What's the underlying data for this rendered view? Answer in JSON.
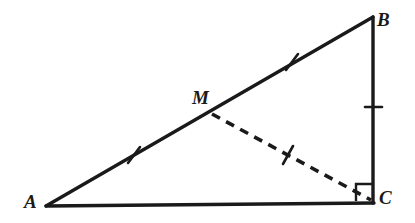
{
  "figure": {
    "type": "geometry-diagram",
    "canvas": {
      "width": 415,
      "height": 223,
      "background": "#ffffff"
    },
    "stroke_color": "#1a1a1a",
    "labels": {
      "a": "A",
      "b": "B",
      "c": "C",
      "m": "M"
    },
    "points": {
      "A": {
        "x": 46,
        "y": 206,
        "label": "A",
        "label_x": 31,
        "label_y": 202
      },
      "B": {
        "x": 373,
        "y": 17,
        "label": "B",
        "label_x": 384,
        "label_y": 20
      },
      "C": {
        "x": 373,
        "y": 202,
        "label": "C",
        "label_x": 386,
        "label_y": 198
      },
      "M": {
        "x": 212,
        "y": 114,
        "label": "M",
        "label_x": 200,
        "label_y": 99
      }
    },
    "segments": [
      {
        "name": "hypotenuse-ab",
        "from": "A",
        "to": "B",
        "style": "solid",
        "width": 3.4
      },
      {
        "name": "base-ac",
        "from": "A",
        "to": "C",
        "style": "solid",
        "width": 3.4
      },
      {
        "name": "leg-bc",
        "from": "B",
        "to": "C",
        "style": "solid",
        "width": 3.4
      },
      {
        "name": "median-mc",
        "from": "M",
        "to": "C",
        "style": "dashed",
        "width": 3.6,
        "dash": "9 7"
      }
    ],
    "tick_marks": [
      {
        "name": "tick-am",
        "on": "segment-am",
        "x": 134,
        "y": 155,
        "angle": -30,
        "length": 16
      },
      {
        "name": "tick-mb",
        "on": "segment-mb",
        "x": 292,
        "y": 62,
        "angle": -30,
        "length": 16
      },
      {
        "name": "tick-mc",
        "on": "segment-mc",
        "x": 288,
        "y": 155,
        "angle": 28,
        "length": 16
      },
      {
        "name": "tick-bc",
        "on": "segment-bc",
        "x": 373,
        "y": 107,
        "angle": 90,
        "length": 17
      }
    ],
    "right_angle": {
      "name": "right-angle-c",
      "at": "C",
      "x": 356,
      "y": 184,
      "size": 17,
      "value": "90"
    }
  }
}
